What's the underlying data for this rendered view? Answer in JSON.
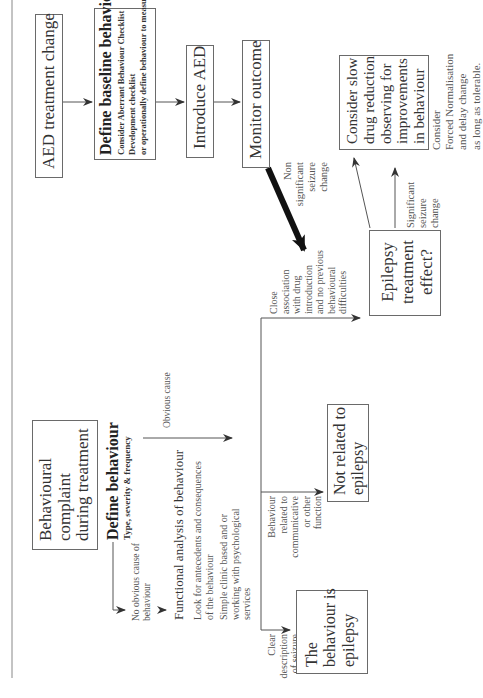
{
  "diagram": {
    "caption_rule": true,
    "nodes": {
      "aed_change": "AED treatment change",
      "baseline_title": "Define baseline behaviour",
      "baseline_line1": "Consider Aberrant Behaviour Checklist",
      "baseline_line2": "Development checklist",
      "baseline_line3": "or operationally define behaviour to measure",
      "introduce_aed": "Introduce AED",
      "monitor_outcome": "Monitor outcome",
      "slow_reduction": [
        "Consider slow",
        "drug reduction",
        "observing for",
        "improvements",
        "in behaviour"
      ],
      "forced_norm": [
        "Consider",
        "Forced Normalisation",
        "and delay change",
        "as long as tolerable."
      ],
      "complaint": [
        "Behavioural",
        "complaint",
        "during treatment"
      ],
      "define_title": "Define behaviour",
      "define_sub": "Type, severity & frequency",
      "no_obvious": [
        "No obvious cause of",
        "behaviour"
      ],
      "functional_title": "Functional analysis of behaviour",
      "functional_l1": [
        "Look for antecedents and consequences",
        "of the behaviour"
      ],
      "functional_l2": [
        "Simple clinic based and or",
        "working with psychological",
        "services"
      ],
      "obvious_cause": "Obvious cause",
      "clear_desc": [
        "Clear",
        "description",
        "of seizure",
        "or video",
        "evidence"
      ],
      "related_comm": [
        "Behaviour",
        "related to",
        "communicative",
        "or other",
        "function"
      ],
      "close_assoc": [
        "Close",
        "association",
        "with drug",
        "introduction",
        "and no previous",
        "behavioural",
        "difficulties"
      ],
      "non_significant": [
        "Non",
        "significant",
        "seizure",
        "change"
      ],
      "significant": [
        "Significant",
        "seizure",
        "change"
      ],
      "epilepsy_effect": [
        "Epilepsy",
        "treatment",
        "effect?"
      ],
      "not_related": [
        "Not related to",
        "epilepsy"
      ],
      "is_epilepsy": [
        "The",
        "behaviour is",
        "epilepsy"
      ]
    },
    "colors": {
      "line": "#555555",
      "box_border": "#6a6a6a",
      "text": "#333333",
      "background": "#ffffff"
    }
  }
}
